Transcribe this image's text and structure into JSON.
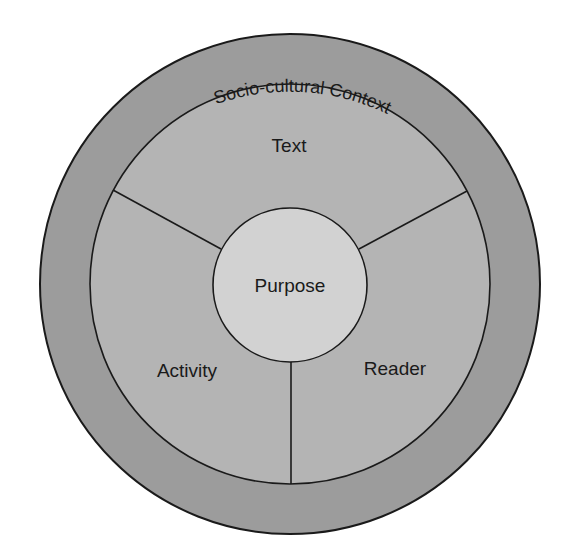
{
  "diagram": {
    "type": "nested-circle-model",
    "colors": {
      "background": "#ffffff",
      "outer_ring": "#9c9c9c",
      "inner_region": "#b4b4b4",
      "center_circle": "#d2d2d2",
      "stroke": "#1a1a1a",
      "text": "#1a1a1a"
    },
    "outer_ring": {
      "label": "Socio-cultural Context"
    },
    "segments": [
      {
        "id": "text",
        "label": "Text"
      },
      {
        "id": "activity",
        "label": "Activity"
      },
      {
        "id": "reader",
        "label": "Reader"
      }
    ],
    "center": {
      "label": "Purpose"
    }
  }
}
